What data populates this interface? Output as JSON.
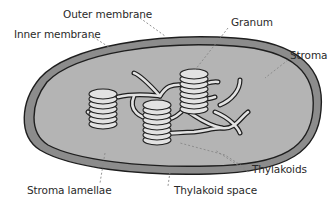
{
  "labels": {
    "outer_membrane": "Outer membrane",
    "inner_membrane": "Inner membrane",
    "granum": "Granum",
    "stroma": "Stroma",
    "thylakoids": "Thylakoids",
    "stroma_lamellae": "Stroma lamellae",
    "thylakoid_space": "Thylakoid space"
  },
  "colors": {
    "outer_membrane_fill": "#8c8c8c",
    "stroma_fill": "#b4b4b4",
    "outline": "#1e1e1e",
    "thylakoid_fill": "#e2e2e2",
    "leader_line": "#888888",
    "label_text": "#2a2a2a"
  }
}
